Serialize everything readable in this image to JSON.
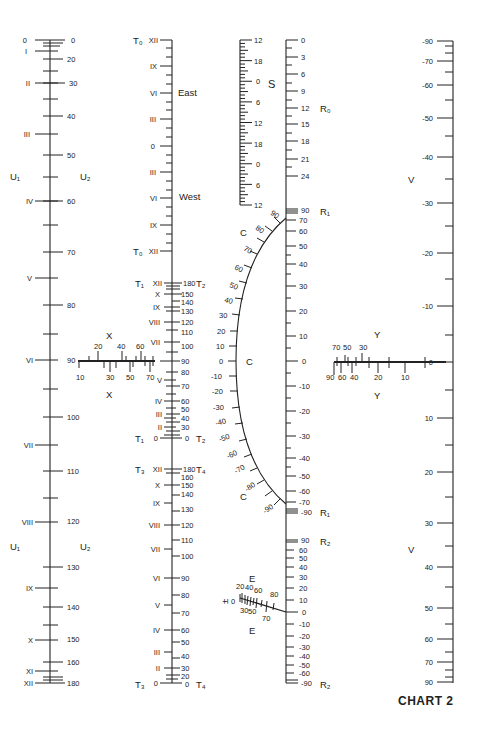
{
  "title": "CHART 2",
  "chart_data": {
    "type": "nomogram",
    "title": "CHART 2",
    "scales": {
      "U": {
        "left_label": "U₁",
        "right_label": "U₂",
        "left_ticks": [
          "0",
          "I",
          "II",
          "III",
          "IV",
          "V",
          "VI",
          "VII",
          "VIII",
          "IX",
          "X",
          "XI",
          "XII"
        ],
        "right_ticks": [
          "0",
          "20",
          "30",
          "40",
          "50",
          "60",
          "70",
          "80",
          "90",
          "100",
          "110",
          "120",
          "130",
          "140",
          "150",
          "160",
          "180"
        ]
      },
      "T0": {
        "label": "T₀",
        "ticks": [
          "XII",
          "IX",
          "VI",
          "III",
          "0",
          "III",
          "VI",
          "IX",
          "XII"
        ],
        "annotations": [
          "East",
          "West"
        ]
      },
      "T1T2": {
        "left_label": "T₁",
        "right_label": "T₂",
        "left_ticks": [
          "XII",
          "X",
          "IX",
          "VIII",
          "VII",
          "V",
          "IV",
          "III",
          "II",
          "0"
        ],
        "right_ticks": [
          "180",
          "150",
          "140",
          "130",
          "120",
          "110",
          "100",
          "90",
          "80",
          "70",
          "60",
          "50",
          "40",
          "30",
          "0"
        ]
      },
      "T3T4": {
        "left_label": "T₃",
        "right_label": "T₄",
        "left_ticks": [
          "XII",
          "X",
          "IX",
          "VIII",
          "VII",
          "VI",
          "V",
          "IV",
          "III",
          "II",
          "0"
        ],
        "right_ticks": [
          "180",
          "160",
          "150",
          "140",
          "130",
          "120",
          "110",
          "100",
          "90",
          "80",
          "70",
          "60",
          "50",
          "40",
          "30",
          "20",
          "0"
        ]
      },
      "X": {
        "label": "X",
        "top_ticks": [
          "20",
          "40",
          "60"
        ],
        "bottom_ticks": [
          "10",
          "30",
          "50",
          "70"
        ]
      },
      "S": {
        "label": "S",
        "ticks": [
          "12",
          "18",
          "0",
          "6",
          "12",
          "18",
          "0",
          "6",
          "12"
        ]
      },
      "R0": {
        "label": "R₀",
        "ticks": [
          "0",
          "3",
          "6",
          "9",
          "12",
          "15",
          "18",
          "21",
          "24"
        ]
      },
      "R1": {
        "label": "R₁",
        "ticks": [
          "90",
          "70",
          "60",
          "50",
          "40",
          "30",
          "20",
          "10",
          "0",
          "-10",
          "-20",
          "-30",
          "-40",
          "-50",
          "-60",
          "-70",
          "-90"
        ]
      },
      "R2": {
        "label": "R₂",
        "ticks": [
          "90",
          "60",
          "50",
          "40",
          "30",
          "20",
          "10",
          "0",
          "-10",
          "-20",
          "-30",
          "-40",
          "-50",
          "-60",
          "-90"
        ]
      },
      "C": {
        "label": "C",
        "ticks": [
          "90",
          "80",
          "70",
          "60",
          "50",
          "40",
          "30",
          "20",
          "10",
          "0",
          "-10",
          "-20",
          "-30",
          "-40",
          "-50",
          "-60",
          "-70",
          "-80",
          "-90"
        ]
      },
      "E": {
        "label": "E",
        "pm_label": "±",
        "top_ticks": [
          "0",
          "20",
          "40",
          "60",
          "80"
        ],
        "bottom_ticks": [
          "30",
          "50",
          "70"
        ]
      },
      "Y": {
        "label": "Y",
        "top_ticks": [
          "70",
          "50",
          "30"
        ],
        "bottom_ticks": [
          "90",
          "60",
          "40",
          "20",
          "10"
        ]
      },
      "V": {
        "label": "V",
        "ticks": [
          "-90",
          "-70",
          "-60",
          "-50",
          "-40",
          "-30",
          "-20",
          "-10",
          "0",
          "10",
          "20",
          "30",
          "40",
          "50",
          "60",
          "70",
          "90"
        ]
      }
    }
  }
}
